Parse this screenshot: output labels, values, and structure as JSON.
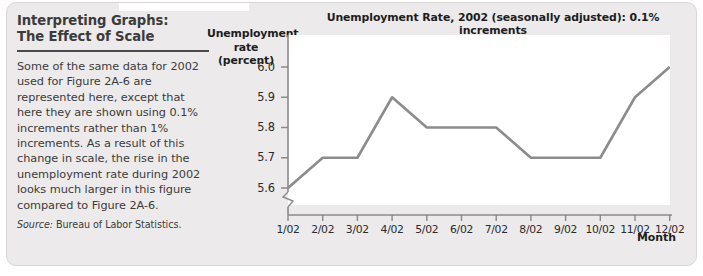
{
  "caption": {
    "title": "Interpreting Graphs:\nThe Effect of Scale",
    "body": "Some of the same data for 2002 used for Figure 2A-6 are represented here, except that here they are shown using 0.1% increments rather than 1% increments. As a result of this change in scale, the rise in the unemployment rate during 2002 looks much larger in this figure compared to Figure 2A-6.",
    "source_label": "Source:",
    "source_text": " Bureau of Labor Statistics."
  },
  "chart_data": {
    "type": "line",
    "title": "Unemployment Rate, 2002 (seasonally adjusted): 0.1% increments",
    "xlabel": "Month",
    "ylabel": "Unemployment\nrate (percent)",
    "categories": [
      "1/02",
      "2/02",
      "3/02",
      "4/02",
      "5/02",
      "6/02",
      "7/02",
      "8/02",
      "9/02",
      "10/02",
      "11/02",
      "12/02"
    ],
    "values": [
      5.6,
      5.7,
      5.7,
      5.9,
      5.8,
      5.8,
      5.8,
      5.7,
      5.7,
      5.7,
      5.9,
      6.0
    ],
    "ylim": [
      5.6,
      6.0
    ],
    "yticks": [
      "6.0",
      "5.9",
      "5.8",
      "5.7",
      "5.6"
    ],
    "ytick_values": [
      6.0,
      5.9,
      5.8,
      5.7,
      5.6
    ],
    "axis_break": true,
    "grid": false,
    "legend": false,
    "line_color": "#8c8c8c",
    "axis_color": "#8a8a8a",
    "plot_background": "#ffffff"
  }
}
